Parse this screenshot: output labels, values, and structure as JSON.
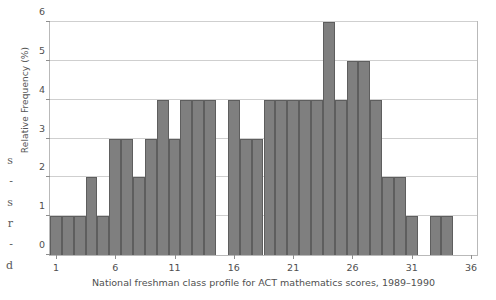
{
  "margin_bleed_text": [
    "s",
    "-",
    "s",
    "r",
    "-",
    "d"
  ],
  "caption": "National freshman class profile for ACT mathematics scores, 1989–1990",
  "colors": {
    "bar_fill": "#7f7f7f",
    "bar_edge": "#5e5e5e",
    "gridline": "#cfcfcf",
    "frame": "#b9b9b9",
    "text": "#4f4f4f"
  },
  "chart_data": {
    "type": "bar",
    "title": "",
    "subtitle": "",
    "xlabel": "National freshman class profile for ACT mathematics scores, 1989–1990",
    "ylabel": "Relative Frequency (%)",
    "xlim": [
      0.5,
      36.5
    ],
    "ylim": [
      0,
      6
    ],
    "xticks": [
      1,
      6,
      11,
      16,
      21,
      26,
      31,
      36
    ],
    "yticks": [
      0,
      1,
      2,
      3,
      4,
      5,
      6
    ],
    "grid": "horizontal",
    "legend": "none",
    "bar_width": 1,
    "categories": [
      1,
      2,
      3,
      4,
      5,
      6,
      7,
      8,
      9,
      10,
      11,
      12,
      13,
      14,
      15,
      16,
      17,
      18,
      19,
      20,
      21,
      22,
      23,
      24,
      25,
      26,
      27,
      28,
      29,
      30,
      31,
      32,
      33,
      34,
      35,
      36
    ],
    "values": [
      1,
      1,
      1,
      2,
      1,
      3,
      3,
      2,
      3,
      4,
      3,
      4,
      4,
      4,
      0,
      4,
      3,
      3,
      4,
      4,
      4,
      4,
      4,
      6,
      4,
      5,
      5,
      4,
      2,
      2,
      1,
      0,
      1,
      1,
      0,
      0
    ]
  }
}
